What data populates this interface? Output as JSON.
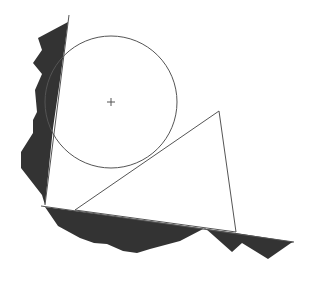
{
  "diagram": {
    "background": "#ffffff",
    "stroke_color": "#555555",
    "wall_fill": "#333333",
    "circle": {
      "cx": 111,
      "cy": 102,
      "r": 66
    },
    "center_marker": {
      "x": 111,
      "y": 102,
      "size": 4
    },
    "triangle": {
      "points": "75,210 219,111 236,232"
    },
    "left_wall": {
      "edge_line": {
        "x1": 69,
        "y1": 15,
        "x2": 45,
        "y2": 205
      },
      "polygon": "68,22 38,38 42,50 33,63 42,74 35,90 37,112 33,120 33,133 21,152 21,168 42,195 45,205 53,128 60,80"
    },
    "bottom_wall": {
      "edge_line": {
        "x1": 41,
        "y1": 206,
        "x2": 294,
        "y2": 242
      },
      "polygon": "45,207 58,226 80,238 94,243 107,244 123,251 137,253 150,249 180,241 205,228 232,252 242,243 268,259 291,243 294,242 236,233 75,211"
    }
  }
}
